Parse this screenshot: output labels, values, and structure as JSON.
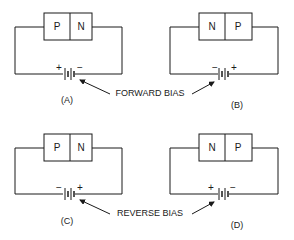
{
  "diagram": {
    "type": "pn-junction-bias",
    "panels": [
      {
        "id": "A",
        "label": "(A)",
        "left_region": "P",
        "right_region": "N",
        "battery_left_sign": "+",
        "battery_right_sign": "−",
        "bias": "forward"
      },
      {
        "id": "B",
        "label": "(B)",
        "left_region": "N",
        "right_region": "P",
        "battery_left_sign": "−",
        "battery_right_sign": "+",
        "bias": "forward"
      },
      {
        "id": "C",
        "label": "(C)",
        "left_region": "P",
        "right_region": "N",
        "battery_left_sign": "−",
        "battery_right_sign": "+",
        "bias": "reverse"
      },
      {
        "id": "D",
        "label": "(D)",
        "left_region": "N",
        "right_region": "P",
        "battery_left_sign": "+",
        "battery_right_sign": "−",
        "bias": "reverse"
      }
    ],
    "captions": {
      "forward": "FORWARD BIAS",
      "reverse": "REVERSE BIAS"
    },
    "colors": {
      "line": "#1a1a1a",
      "background": "#ffffff"
    }
  }
}
